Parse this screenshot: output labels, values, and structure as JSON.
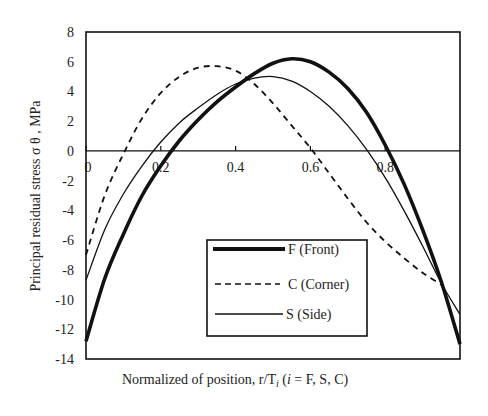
{
  "chart_data": {
    "type": "line",
    "title": "",
    "xlabel": "Normalized of position, r/T",
    "xlabel_sub": "i",
    "xlabel_suffix": "(",
    "xlabel_i": "i",
    "xlabel_tail": " = F, S, C)",
    "ylabel": "Principal residual stress σ θ , MPa",
    "xlim": [
      0,
      1
    ],
    "ylim": [
      -14,
      8
    ],
    "x_ticks": [
      "0",
      "0.2",
      "0.4",
      "0.6",
      "0.8"
    ],
    "y_ticks": [
      "8",
      "6",
      "4",
      "2",
      "0",
      "-2",
      "-4",
      "-6",
      "-8",
      "-10",
      "-12",
      "-14"
    ],
    "grid": false,
    "legend_position": "lower center (inside)",
    "x": [
      0,
      0.05,
      0.1,
      0.15,
      0.2,
      0.25,
      0.3,
      0.35,
      0.4,
      0.45,
      0.5,
      0.55,
      0.6,
      0.65,
      0.7,
      0.75,
      0.8,
      0.85,
      0.9,
      0.95,
      1.0
    ],
    "series": [
      {
        "name": "F (Front)",
        "style": "thick solid",
        "values": [
          -12.8,
          -8.6,
          -5.6,
          -3.0,
          -1.0,
          0.7,
          2.1,
          3.3,
          4.3,
          5.2,
          5.9,
          6.2,
          6.0,
          5.3,
          4.2,
          2.6,
          0.4,
          -2.2,
          -5.3,
          -8.8,
          -13.0
        ]
      },
      {
        "name": "C (Corner)",
        "style": "dashed",
        "values": [
          -7.0,
          -3.0,
          -0.2,
          2.2,
          3.9,
          5.0,
          5.6,
          5.7,
          5.4,
          4.5,
          3.2,
          1.7,
          0.2,
          -1.5,
          -3.2,
          -4.8,
          -6.1,
          -7.2,
          -8.2,
          -9.0,
          null
        ]
      },
      {
        "name": "S (Side)",
        "style": "thin solid",
        "values": [
          -8.7,
          -5.3,
          -2.9,
          -1.0,
          0.6,
          1.9,
          2.9,
          3.8,
          4.5,
          4.9,
          5.0,
          4.7,
          4.0,
          3.0,
          1.7,
          0.1,
          -1.8,
          -4.0,
          -6.4,
          -8.9,
          -11.0
        ]
      }
    ]
  }
}
